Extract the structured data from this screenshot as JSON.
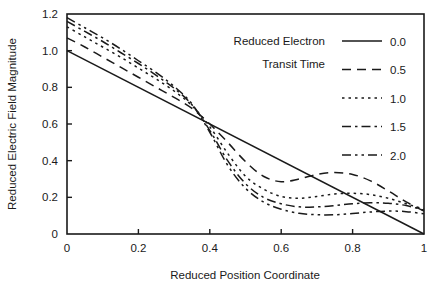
{
  "chart_data": {
    "type": "line",
    "title": "",
    "xlabel": "Reduced Position Coordinate",
    "ylabel": "Reduced Electric Field Magnitude",
    "xlim": [
      0,
      1
    ],
    "ylim": [
      0,
      1.2
    ],
    "grid": false,
    "legend_position": "upper-right-inside",
    "legend_title_lines": [
      "Reduced Electron",
      "Transit Time"
    ],
    "xticks": [
      0,
      0.2,
      0.4,
      0.6,
      0.8,
      1
    ],
    "xtick_labels": [
      "0",
      "0.2",
      "0.4",
      "0.6",
      "0.8",
      "1"
    ],
    "yticks": [
      0,
      0.2,
      0.4,
      0.6,
      0.8,
      1.0,
      1.2
    ],
    "ytick_labels": [
      "0",
      "0.2",
      "0.4",
      "0.6",
      "0.8",
      "1.0",
      "1.2"
    ],
    "line_color": "#1a1a1a",
    "background_color": "#ffffff",
    "x": [
      0,
      0.05,
      0.1,
      0.15,
      0.2,
      0.25,
      0.3,
      0.35,
      0.4,
      0.45,
      0.5,
      0.55,
      0.6,
      0.65,
      0.7,
      0.75,
      0.8,
      0.85,
      0.9,
      0.95,
      1
    ],
    "series": [
      {
        "name": "0.0",
        "label": "0.0",
        "dash": "solid",
        "dasharray": "",
        "values": [
          1.0,
          0.95,
          0.9,
          0.85,
          0.8,
          0.75,
          0.7,
          0.65,
          0.6,
          0.55,
          0.5,
          0.45,
          0.4,
          0.35,
          0.3,
          0.25,
          0.2,
          0.15,
          0.1,
          0.05,
          0.0
        ]
      },
      {
        "name": "0.5",
        "label": "0.5",
        "dash": "dashed",
        "dasharray": "9,6",
        "values": [
          1.07,
          1.02,
          0.965,
          0.91,
          0.855,
          0.8,
          0.745,
          0.685,
          0.6,
          0.5,
          0.395,
          0.315,
          0.285,
          0.3,
          0.325,
          0.335,
          0.325,
          0.29,
          0.235,
          0.175,
          0.125
        ]
      },
      {
        "name": "1.0",
        "label": "1.0",
        "dash": "dotted",
        "dasharray": "2.5,4",
        "values": [
          1.13,
          1.075,
          1.02,
          0.965,
          0.905,
          0.845,
          0.78,
          0.7,
          0.585,
          0.44,
          0.315,
          0.245,
          0.205,
          0.195,
          0.205,
          0.218,
          0.222,
          0.215,
          0.195,
          0.165,
          0.135
        ]
      },
      {
        "name": "1.5",
        "label": "1.5",
        "dash": "dashdot",
        "dasharray": "9,4,2.5,4",
        "values": [
          1.16,
          1.105,
          1.05,
          0.99,
          0.93,
          0.865,
          0.795,
          0.705,
          0.565,
          0.4,
          0.275,
          0.2,
          0.165,
          0.148,
          0.148,
          0.155,
          0.165,
          0.17,
          0.168,
          0.155,
          0.13
        ]
      },
      {
        "name": "2.0",
        "label": "2.0",
        "dash": "dashdotdot",
        "dasharray": "9,4,2.5,4,2.5,4",
        "values": [
          1.18,
          1.125,
          1.07,
          1.01,
          0.945,
          0.88,
          0.805,
          0.71,
          0.555,
          0.375,
          0.25,
          0.175,
          0.135,
          0.113,
          0.105,
          0.105,
          0.112,
          0.12,
          0.125,
          0.122,
          0.11
        ]
      }
    ]
  }
}
